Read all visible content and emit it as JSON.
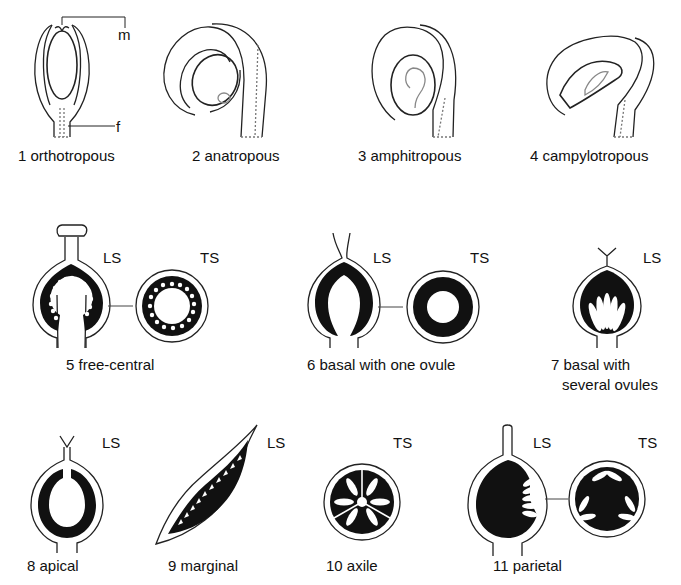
{
  "figure": {
    "ovule_types": [
      {
        "number": "1",
        "name": "orthotropous",
        "label": "1  orthotropous"
      },
      {
        "number": "2",
        "name": "anatropous",
        "label": "2  anatropous"
      },
      {
        "number": "3",
        "name": "amphitropous",
        "label": "3  amphitropous"
      },
      {
        "number": "4",
        "name": "campylotropous",
        "label": "4  campylotropous"
      }
    ],
    "callouts": {
      "micropyle": "m",
      "funicle": "f"
    },
    "placentation_types": [
      {
        "number": "5",
        "label": "5  free-central",
        "sections": [
          "LS",
          "TS"
        ]
      },
      {
        "number": "6",
        "label": "6  basal  with  one ovule",
        "sections": [
          "LS",
          "TS"
        ]
      },
      {
        "number": "7",
        "label_line1": "7  basal  with",
        "label_line2": "several  ovules",
        "sections": [
          "LS"
        ]
      },
      {
        "number": "8",
        "label": "8  apical",
        "sections": [
          "LS"
        ]
      },
      {
        "number": "9",
        "label": "9  marginal",
        "sections": [
          "LS"
        ]
      },
      {
        "number": "10",
        "label": "10  axile",
        "sections": [
          "TS"
        ]
      },
      {
        "number": "11",
        "label": "11  parietal",
        "sections": [
          "LS",
          "TS"
        ]
      }
    ],
    "section_abbrev": {
      "LS": "LS",
      "TS": "TS"
    }
  }
}
